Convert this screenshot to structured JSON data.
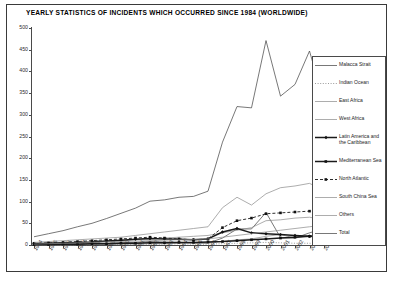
{
  "figure": {
    "title": "YEARLY STATISTICS OF INCIDENTS WHICH OCCURRED SINCE 1984 (WORLDWIDE)"
  },
  "chart_data": {
    "type": "line",
    "title": "YEARLY STATISTICS OF INCIDENTS WHICH OCCURRED SINCE 1984 (WORLDWIDE)",
    "xlabel": "",
    "ylabel": "",
    "ylim": [
      0,
      500
    ],
    "yticks": [
      0,
      50,
      100,
      150,
      200,
      250,
      300,
      350,
      400,
      450,
      500
    ],
    "grid": false,
    "legend_position": "right",
    "categories": [
      "1984",
      "1985",
      "1986",
      "1987",
      "1988",
      "1989",
      "1990",
      "1991",
      "1992",
      "1993",
      "1994",
      "1995",
      "1996",
      "1997",
      "1998",
      "1999",
      "2000",
      "2001",
      "2002",
      "2003",
      "2004"
    ],
    "series": [
      {
        "name": "Malacca Strait",
        "values": [
          1,
          2,
          2,
          3,
          3,
          4,
          5,
          6,
          8,
          7,
          6,
          5,
          4,
          16,
          37,
          37,
          75,
          17,
          16,
          28,
          38
        ]
      },
      {
        "name": "Indian Ocean",
        "values": [
          0,
          0,
          0,
          0,
          0,
          1,
          1,
          1,
          2,
          2,
          3,
          2,
          2,
          3,
          4,
          5,
          6,
          5,
          4,
          4,
          3
        ]
      },
      {
        "name": "East Africa",
        "values": [
          0,
          0,
          0,
          1,
          1,
          1,
          2,
          2,
          3,
          3,
          4,
          4,
          5,
          8,
          12,
          14,
          20,
          24,
          16,
          22,
          10
        ]
      },
      {
        "name": "West Africa",
        "values": [
          2,
          3,
          4,
          5,
          6,
          8,
          10,
          12,
          14,
          16,
          18,
          20,
          22,
          28,
          34,
          40,
          56,
          58,
          62,
          64,
          58
        ]
      },
      {
        "name": "Latin America and the Caribbean",
        "values": [
          3,
          4,
          5,
          6,
          7,
          9,
          11,
          13,
          15,
          14,
          13,
          12,
          14,
          30,
          38,
          28,
          26,
          24,
          22,
          20,
          18
        ]
      },
      {
        "name": "Mediterranean Sea",
        "values": [
          1,
          1,
          2,
          2,
          3,
          3,
          4,
          4,
          5,
          5,
          6,
          6,
          7,
          8,
          10,
          12,
          14,
          16,
          18,
          20,
          22
        ]
      },
      {
        "name": "North Atlantic",
        "values": [
          4,
          5,
          6,
          8,
          10,
          12,
          14,
          16,
          18,
          16,
          14,
          12,
          14,
          40,
          56,
          62,
          72,
          74,
          76,
          78,
          68
        ]
      },
      {
        "name": "South China Sea",
        "values": [
          6,
          8,
          10,
          12,
          14,
          16,
          18,
          22,
          26,
          30,
          34,
          38,
          42,
          86,
          110,
          92,
          118,
          132,
          136,
          142,
          126
        ]
      },
      {
        "name": "Others",
        "values": [
          2,
          3,
          4,
          5,
          6,
          7,
          8,
          9,
          10,
          11,
          12,
          13,
          14,
          18,
          22,
          26,
          30,
          34,
          38,
          42,
          46
        ]
      },
      {
        "name": "Total",
        "values": [
          19,
          26,
          33,
          42,
          50,
          61,
          73,
          85,
          101,
          104,
          110,
          112,
          124,
          237,
          319,
          316,
          471,
          343,
          370,
          447,
          329
        ]
      }
    ]
  },
  "legend": {
    "items": [
      {
        "label": "Malacca Strait",
        "style": "solid-thin",
        "marker": "none"
      },
      {
        "label": "Indian Ocean",
        "style": "dotted",
        "marker": "none"
      },
      {
        "label": "East Africa",
        "style": "solid-light",
        "marker": "none"
      },
      {
        "label": "West Africa",
        "style": "solid-light",
        "marker": "none"
      },
      {
        "label": "Latin America and the Caribbean",
        "style": "solid-thick",
        "marker": "diamond"
      },
      {
        "label": "Mediterranean Sea",
        "style": "solid-thick",
        "marker": "square"
      },
      {
        "label": "North Atlantic",
        "style": "dashed",
        "marker": "square"
      },
      {
        "label": "South China Sea",
        "style": "solid-light",
        "marker": "none"
      },
      {
        "label": "Others",
        "style": "solid-light",
        "marker": "none"
      },
      {
        "label": "Total",
        "style": "solid-thin",
        "marker": "none"
      }
    ]
  }
}
